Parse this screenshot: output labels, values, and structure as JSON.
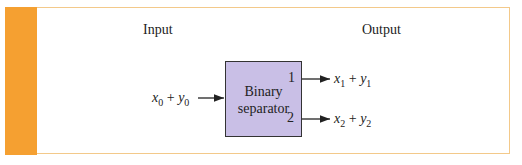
{
  "diagram": {
    "headers": {
      "input": "Input",
      "output": "Output"
    },
    "block": {
      "line1": "Binary",
      "line2": "separator",
      "port1": "1",
      "port2": "2"
    },
    "input_expr": {
      "x": "x",
      "xs": "0",
      "plus": "+",
      "y": "y",
      "ys": "0"
    },
    "output1_expr": {
      "x": "x",
      "xs": "1",
      "plus": "+",
      "y": "y",
      "ys": "1"
    },
    "output2_expr": {
      "x": "x",
      "xs": "2",
      "plus": "+",
      "y": "y",
      "ys": "2"
    },
    "colors": {
      "accent_bar": "#f5a031",
      "frame_border": "#f3c98a",
      "block_fill": "#c9bfe6"
    }
  }
}
